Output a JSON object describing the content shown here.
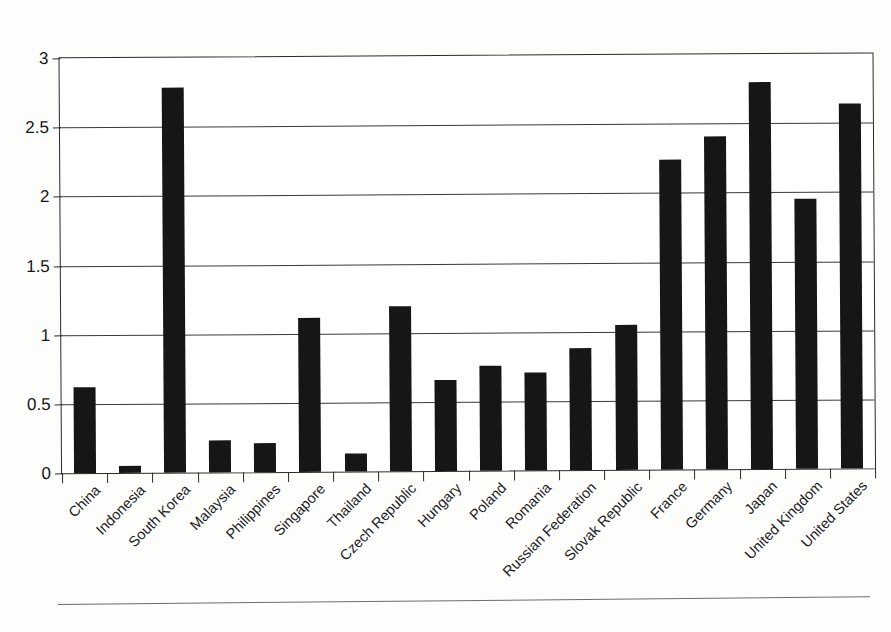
{
  "chart_data": {
    "type": "bar",
    "title": "",
    "subtitle": "",
    "xlabel": "",
    "ylabel": "",
    "ylim": [
      0,
      3
    ],
    "ytick_values": [
      0,
      0.5,
      1,
      1.5,
      2,
      2.5,
      3
    ],
    "ytick_labels": [
      "0",
      "0.5",
      "1",
      "1.5",
      "2",
      "2.5",
      "3"
    ],
    "grid": true,
    "legend": false,
    "legend_position": "none",
    "bar_color": "#161616",
    "categories": [
      "China",
      "Indonesia",
      "South Korea",
      "Malaysia",
      "Philippines",
      "Singapore",
      "Thailand",
      "Czech Republic",
      "Hungary",
      "Poland",
      "Romania",
      "Russian Federation",
      "Slovak Republic",
      "France",
      "Germany",
      "Japan",
      "United Kingdom",
      "United States"
    ],
    "values": [
      0.62,
      0.05,
      2.78,
      0.23,
      0.21,
      1.11,
      0.13,
      1.19,
      0.66,
      0.76,
      0.71,
      0.88,
      1.05,
      2.24,
      2.41,
      2.8,
      1.95,
      2.64
    ]
  }
}
